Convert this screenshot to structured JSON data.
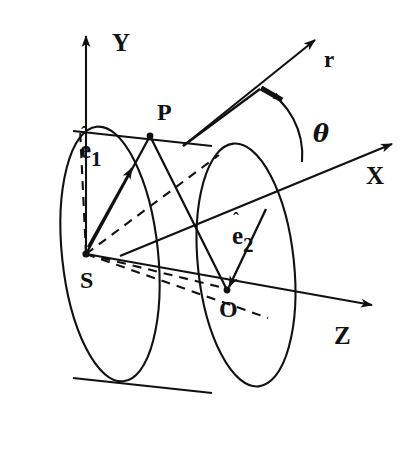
{
  "figure": {
    "kind": "geometry-diagram",
    "stroke_color": "#111111",
    "background_color": "#ffffff"
  },
  "axes": [
    {
      "id": "y-axis",
      "label": "Y",
      "label_x": 112,
      "label_y": 30,
      "direction": "up"
    },
    {
      "id": "x-axis",
      "label": "X",
      "label_x": 366,
      "label_y": 163,
      "direction": "upper-right"
    },
    {
      "id": "z-axis",
      "label": "Z",
      "label_x": 334,
      "label_y": 323,
      "direction": "lower-right"
    }
  ],
  "vectors": [
    {
      "id": "r-vector",
      "label": "r",
      "label_x": 324,
      "label_y": 48
    },
    {
      "id": "e1-vector",
      "label_base": "e",
      "label_hat": "ˆ",
      "label_sub": "1",
      "label_x": 80,
      "label_y": 136
    },
    {
      "id": "e2-vector",
      "label_base": "e",
      "label_hat": "ˆ",
      "label_sub": "2",
      "label_x": 232,
      "label_y": 222
    }
  ],
  "angles": [
    {
      "id": "theta-angle",
      "label": "θ",
      "label_x": 313,
      "label_y": 122
    }
  ],
  "points": [
    {
      "id": "point-p",
      "label": "P",
      "label_x": 157,
      "label_y": 100,
      "x": 150,
      "y": 136
    },
    {
      "id": "point-s",
      "label": "S",
      "label_x": 80,
      "label_y": 268,
      "x": 86,
      "y": 254
    },
    {
      "id": "point-o",
      "label": "O",
      "label_x": 219,
      "label_y": 297,
      "x": 226,
      "y": 290
    }
  ]
}
